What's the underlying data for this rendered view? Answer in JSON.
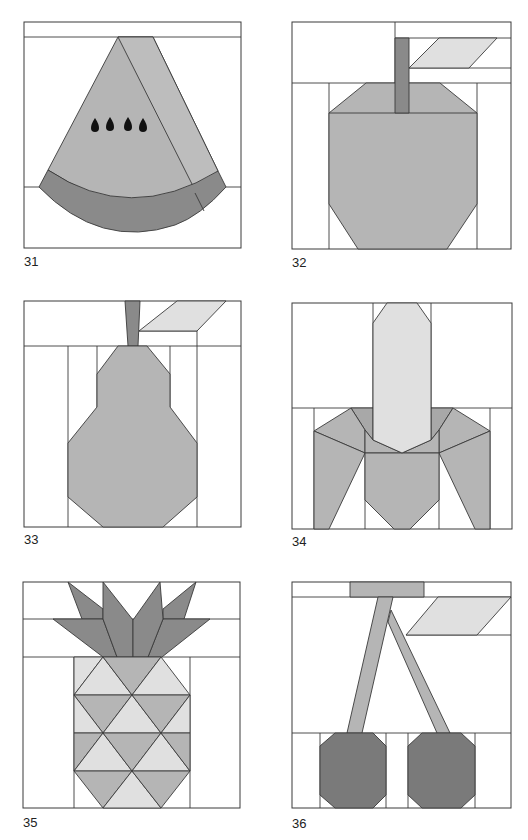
{
  "colors": {
    "light": "#e0e0e0",
    "medium": "#b5b5b5",
    "dark": "#8a8a8a",
    "darker": "#7a7a7a",
    "line": "#3a3a3a",
    "seed": "#111111",
    "background": "#ffffff"
  },
  "blocks": [
    {
      "number": "31",
      "subject": "watermelon-slice"
    },
    {
      "number": "32",
      "subject": "apple"
    },
    {
      "number": "33",
      "subject": "pear"
    },
    {
      "number": "34",
      "subject": "banana"
    },
    {
      "number": "35",
      "subject": "pineapple"
    },
    {
      "number": "36",
      "subject": "cherries"
    }
  ]
}
